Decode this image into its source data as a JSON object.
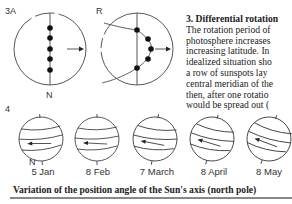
{
  "figure3": {
    "panel_a_label": "3A",
    "panel_r_label": "R",
    "north_label": "N"
  },
  "figure4": {
    "label": "4",
    "north_label": "N",
    "dates": [
      "5 Jan",
      "8 Feb",
      "7 March",
      "8 April",
      "8 May"
    ]
  },
  "side_text": {
    "heading": "3. Differential rotation",
    "lines": [
      "The rotation period of",
      "photosphere increases",
      "increasing latitude. In",
      "idealized situation sho",
      "a row of sunspots lay",
      "central meridian of the",
      "then, after one rotatio",
      "would be spread out ("
    ]
  },
  "caption": "Variation of the position angle of the Sun's axis (north pole)"
}
